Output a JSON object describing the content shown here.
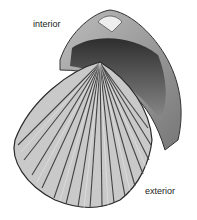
{
  "labels": {
    "interior": "interior",
    "exterior": "exterior"
  },
  "image": {
    "subject": "cockle-shell-illustration",
    "colors": {
      "background": "#ffffff",
      "shell_light": "#d8d8d8",
      "shell_mid": "#9a9a9a",
      "shell_dark": "#3a3a3a"
    }
  }
}
